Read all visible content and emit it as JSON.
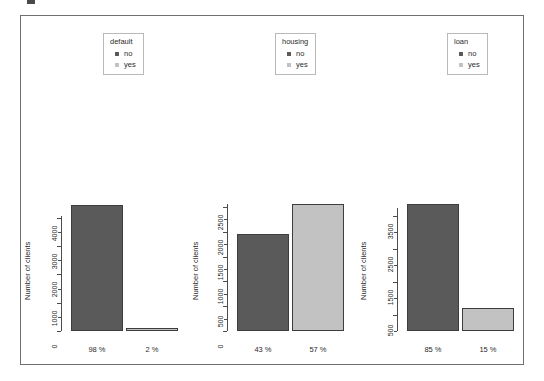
{
  "figure": {
    "background": "#ffffff",
    "frame_color": "#6f6f6f",
    "bar_dark_color": "#5a5a5a",
    "bar_light_color": "#c2c2c2",
    "bar_border_color": "#3d3d3d",
    "axis_color": "#4d4d4d"
  },
  "chart_data": [
    {
      "type": "bar",
      "title": "default",
      "xlabel": "",
      "ylabel": "Number of clients",
      "categories": [
        "98 %",
        "2 %"
      ],
      "series_names": [
        "no",
        "yes"
      ],
      "values": [
        4445,
        90
      ],
      "bar_colors": [
        "#5a5a5a",
        "#c2c2c2"
      ],
      "ylim": [
        0,
        4600
      ],
      "yticks": [
        0,
        1000,
        2000,
        3000,
        4000
      ],
      "yticks_minor": [
        500,
        1500,
        2500,
        3500
      ],
      "grid": false,
      "legend_position": "top-center",
      "legend_title": "default",
      "legend_entries": [
        "no",
        "yes"
      ]
    },
    {
      "type": "bar",
      "title": "housing",
      "xlabel": "",
      "ylabel": "Number of clients",
      "categories": [
        "43 %",
        "57 %"
      ],
      "series_names": [
        "no",
        "yes"
      ],
      "values": [
        1950,
        2560
      ],
      "bar_colors": [
        "#5a5a5a",
        "#c2c2c2"
      ],
      "ylim": [
        0,
        2620
      ],
      "yticks": [
        0,
        500,
        1000,
        1500,
        2000,
        2500
      ],
      "yticks_minor": [
        250,
        750,
        1250,
        1750,
        2250
      ],
      "grid": false,
      "legend_position": "top-center",
      "legend_title": "housing",
      "legend_entries": [
        "no",
        "yes"
      ]
    },
    {
      "type": "bar",
      "title": "loan",
      "xlabel": "",
      "ylabel": "Number of clients",
      "categories": [
        "85 %",
        "15 %"
      ],
      "series_names": [
        "no",
        "yes"
      ],
      "values": [
        3850,
        700
      ],
      "bar_colors": [
        "#5a5a5a",
        "#c2c2c2"
      ],
      "ylim": [
        0,
        3950
      ],
      "yticks": [
        500,
        1500,
        2500,
        3500
      ],
      "yticks_minor": [
        0,
        1000,
        2000,
        3000
      ],
      "grid": false,
      "legend_position": "top-center",
      "legend_title": "loan",
      "legend_entries": [
        "no",
        "yes"
      ]
    }
  ],
  "panels": [
    {
      "legend": {
        "title": "default",
        "items": [
          {
            "label": "no",
            "color": "#5a5a5a"
          },
          {
            "label": "yes",
            "color": "#c2c2c2"
          }
        ]
      },
      "ylabel": "Number of clients",
      "yticks": [
        {
          "label": "0",
          "value": 0
        },
        {
          "label": "1000",
          "value": 1000
        },
        {
          "label": "2000",
          "value": 2000
        },
        {
          "label": "3000",
          "value": 3000
        },
        {
          "label": "4000",
          "value": 4000
        }
      ],
      "bars": [
        {
          "xlabel": "98 %",
          "value": 4445,
          "color": "#5a5a5a"
        },
        {
          "xlabel": "2 %",
          "value": 90,
          "color": "#c2c2c2"
        }
      ]
    },
    {
      "legend": {
        "title": "housing",
        "items": [
          {
            "label": "no",
            "color": "#5a5a5a"
          },
          {
            "label": "yes",
            "color": "#c2c2c2"
          }
        ]
      },
      "ylabel": "Number of clients",
      "yticks": [
        {
          "label": "0",
          "value": 0
        },
        {
          "label": "500",
          "value": 500
        },
        {
          "label": "1000",
          "value": 1000
        },
        {
          "label": "1500",
          "value": 1500
        },
        {
          "label": "2000",
          "value": 2000
        },
        {
          "label": "2500",
          "value": 2500
        }
      ],
      "bars": [
        {
          "xlabel": "43 %",
          "value": 1950,
          "color": "#5a5a5a"
        },
        {
          "xlabel": "57 %",
          "value": 2560,
          "color": "#c2c2c2"
        }
      ]
    },
    {
      "legend": {
        "title": "loan",
        "items": [
          {
            "label": "no",
            "color": "#5a5a5a"
          },
          {
            "label": "yes",
            "color": "#c2c2c2"
          }
        ]
      },
      "ylabel": "Number of clients",
      "yticks": [
        {
          "label": "500",
          "value": 500
        },
        {
          "label": "1500",
          "value": 1500
        },
        {
          "label": "2500",
          "value": 2500
        },
        {
          "label": "3500",
          "value": 3500
        }
      ],
      "bars": [
        {
          "xlabel": "85 %",
          "value": 3850,
          "color": "#5a5a5a"
        },
        {
          "xlabel": "15 %",
          "value": 700,
          "color": "#c2c2c2"
        }
      ]
    }
  ]
}
